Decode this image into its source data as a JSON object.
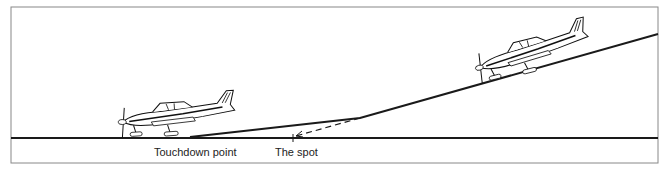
{
  "figure": {
    "labels": {
      "touchdown_point": "Touchdown point",
      "the_spot": "The spot"
    },
    "caption": ""
  },
  "geometry": {
    "frame": {
      "x": 11,
      "y": 7,
      "w": 647,
      "h": 156
    },
    "ground_y": 138,
    "flight_path": [
      [
        658,
        34
      ],
      [
        360,
        118
      ],
      [
        190,
        137
      ]
    ],
    "dashed_projection": {
      "from": [
        360,
        118
      ],
      "to": [
        293,
        137
      ]
    },
    "spot_x": 293,
    "touchdown_x": 190
  },
  "colors": {
    "line": "#1a1a1a",
    "frame": "#888888"
  }
}
